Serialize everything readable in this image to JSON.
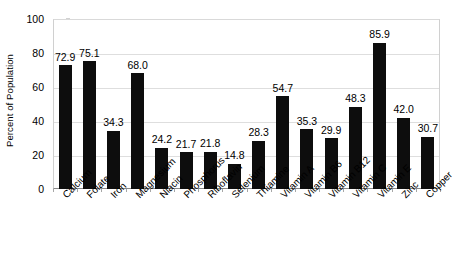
{
  "chart_data": {
    "type": "bar",
    "title": "",
    "subtitle": "",
    "xlabel": "",
    "ylabel": "Percent of Population",
    "ylim": [
      0,
      100
    ],
    "ytick_step": 20,
    "yticks": [
      100,
      80,
      60,
      40,
      20,
      0
    ],
    "grid": true,
    "legend": false,
    "legend_position": "none",
    "bar_color": "#0d0d0d",
    "gridline_color": "#dedede",
    "axis_color": "#888888",
    "background_color": "#ffffff",
    "xtick_label_rotation": -45,
    "data_labels": true,
    "categories": [
      "Calcium",
      "Folate",
      "Iron",
      "Magnesium",
      "Niacin",
      "Phosphorus",
      "Riboflavin",
      "Selenium",
      "Thiamine",
      "Vitamin A",
      "Vitamin B6",
      "Vitamin B12",
      "Vitamin C",
      "Vitamin E",
      "Zinc",
      "Copper"
    ],
    "values": [
      72.9,
      75.1,
      34.3,
      68.0,
      24.2,
      21.7,
      21.8,
      14.8,
      28.3,
      54.7,
      35.3,
      29.9,
      48.3,
      85.9,
      42.0,
      30.7
    ],
    "value_labels": [
      "72.9",
      "75.1",
      "34.3",
      "68.0",
      "24.2",
      "21.7",
      "21.8",
      "14.8",
      "28.3",
      "54.7",
      "35.3",
      "29.9",
      "48.3",
      "85.9",
      "42.0",
      "30.7"
    ]
  }
}
